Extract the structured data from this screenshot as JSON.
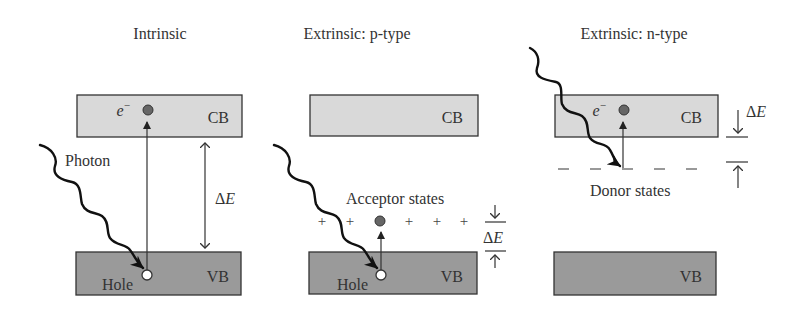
{
  "diagram": {
    "type": "semiconductor-band-diagrams",
    "panels": [
      {
        "id": "intrinsic",
        "title": "Intrinsic",
        "conduction_band": "CB",
        "valence_band": "VB",
        "electron_label": "e",
        "electron_superscript": "−",
        "hole_label": "Hole",
        "photon_label": "Photon",
        "gap_label_delta": "Δ",
        "gap_label_var": "E"
      },
      {
        "id": "p-type",
        "title": "Extrinsic: p-type",
        "conduction_band": "CB",
        "valence_band": "VB",
        "states_label": "Acceptor states",
        "state_marker": "+",
        "hole_label": "Hole",
        "gap_label_delta": "Δ",
        "gap_label_var": "E"
      },
      {
        "id": "n-type",
        "title": "Extrinsic: n-type",
        "conduction_band": "CB",
        "valence_band": "VB",
        "electron_label": "e",
        "electron_superscript": "−",
        "states_label": "Donor states",
        "gap_label_delta": "Δ",
        "gap_label_var": "E"
      }
    ],
    "colors": {
      "conduction_band_fill": "#d9d9d9",
      "valence_band_fill": "#9a9a9a",
      "electron_fill": "#666666",
      "hole_fill": "#ffffff",
      "line": "#333333"
    }
  }
}
